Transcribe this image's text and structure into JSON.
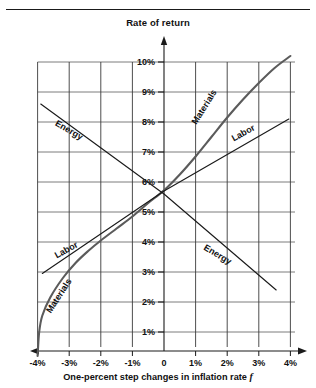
{
  "figure": {
    "title": "Rate of return",
    "x_caption_main": "One-percent step changes in inflation rate",
    "x_caption_symbol": "f"
  },
  "chart_data": {
    "type": "line",
    "title": "Rate of return",
    "xlabel": "One-percent step changes in inflation rate f",
    "ylabel": "Rate of return",
    "xlim": [
      -4,
      4
    ],
    "ylim": [
      0,
      10.5
    ],
    "grid": true,
    "legend": "inline-curve-labels",
    "x_tick_labels": [
      "-4%",
      "-3%",
      "-2%",
      "-1%",
      "0",
      "1%",
      "2%",
      "3%",
      "4%"
    ],
    "x_tick_values": [
      -4,
      -3,
      -2,
      -1,
      0,
      1,
      2,
      3,
      4
    ],
    "y_tick_labels": [
      "1%",
      "2%",
      "3%",
      "4%",
      "5%",
      "6%",
      "7%",
      "8%",
      "9%",
      "10%"
    ],
    "y_tick_values": [
      1,
      2,
      3,
      4,
      5,
      6,
      7,
      8,
      9,
      10
    ],
    "series": [
      {
        "name": "Materials",
        "style": "thick-curve",
        "color": "#5b5b5b",
        "points": [
          [
            -4.0,
            0.2
          ],
          [
            -3.95,
            1.0
          ],
          [
            -3.85,
            1.55
          ],
          [
            -3.6,
            2.15
          ],
          [
            -3.2,
            2.8
          ],
          [
            -2.8,
            3.3
          ],
          [
            -2.4,
            3.7
          ],
          [
            -2.0,
            4.05
          ],
          [
            -1.5,
            4.45
          ],
          [
            -1.0,
            4.85
          ],
          [
            -0.5,
            5.3
          ],
          [
            0.0,
            5.72
          ],
          [
            0.5,
            6.25
          ],
          [
            1.0,
            6.85
          ],
          [
            1.5,
            7.5
          ],
          [
            2.0,
            8.15
          ],
          [
            2.5,
            8.75
          ],
          [
            3.0,
            9.3
          ],
          [
            3.5,
            9.8
          ],
          [
            4.0,
            10.2
          ]
        ]
      },
      {
        "name": "Labor",
        "style": "thin-line",
        "color": "#1a1a1a",
        "points": [
          [
            -3.85,
            2.95
          ],
          [
            0.0,
            5.7
          ],
          [
            3.95,
            8.1
          ]
        ]
      },
      {
        "name": "Energy",
        "style": "thin-line",
        "color": "#1a1a1a",
        "points": [
          [
            -3.9,
            8.6
          ],
          [
            0.0,
            5.6
          ],
          [
            3.55,
            2.4
          ]
        ]
      }
    ],
    "curve_labels": [
      {
        "text": "Energy",
        "x": -3.05,
        "y": 7.65,
        "rotation": 30
      },
      {
        "text": "Labor",
        "x": 2.55,
        "y": 7.55,
        "rotation": -29
      },
      {
        "text": "Materials",
        "x": 1.35,
        "y": 8.45,
        "rotation": -58
      },
      {
        "text": "Labor",
        "x": -3.05,
        "y": 3.65,
        "rotation": -29
      },
      {
        "text": "Materials",
        "x": -3.25,
        "y": 2.15,
        "rotation": -57
      },
      {
        "text": "Energy",
        "x": 1.65,
        "y": 3.5,
        "rotation": 31
      }
    ]
  }
}
